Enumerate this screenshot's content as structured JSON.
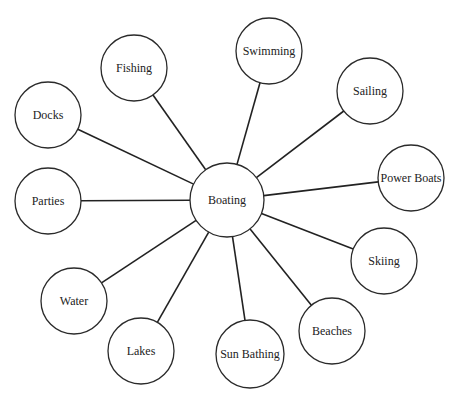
{
  "diagram": {
    "type": "concept-web",
    "center": {
      "id": "boating",
      "label": "Boating",
      "cx": 227,
      "cy": 200,
      "r": 37
    },
    "nodes": [
      {
        "id": "fishing",
        "label": "Fishing",
        "cx": 134,
        "cy": 68,
        "r": 33
      },
      {
        "id": "swimming",
        "label": "Swimming",
        "cx": 269,
        "cy": 51,
        "r": 33
      },
      {
        "id": "sailing",
        "label": "Sailing",
        "cx": 370,
        "cy": 91,
        "r": 33
      },
      {
        "id": "power-boats",
        "label": "Power Boats",
        "cx": 411,
        "cy": 178,
        "r": 33
      },
      {
        "id": "skiing",
        "label": "Skiing",
        "cx": 384,
        "cy": 261,
        "r": 33
      },
      {
        "id": "beaches",
        "label": "Beaches",
        "cx": 332,
        "cy": 331,
        "r": 33
      },
      {
        "id": "sun-bathing",
        "label": "Sun Bathing",
        "cx": 250,
        "cy": 354,
        "r": 34
      },
      {
        "id": "lakes",
        "label": "Lakes",
        "cx": 141,
        "cy": 351,
        "r": 33
      },
      {
        "id": "water",
        "label": "Water",
        "cx": 74,
        "cy": 301,
        "r": 33
      },
      {
        "id": "parties",
        "label": "Parties",
        "cx": 48,
        "cy": 201,
        "r": 33
      },
      {
        "id": "docks",
        "label": "Docks",
        "cx": 48,
        "cy": 115,
        "r": 33
      }
    ]
  }
}
